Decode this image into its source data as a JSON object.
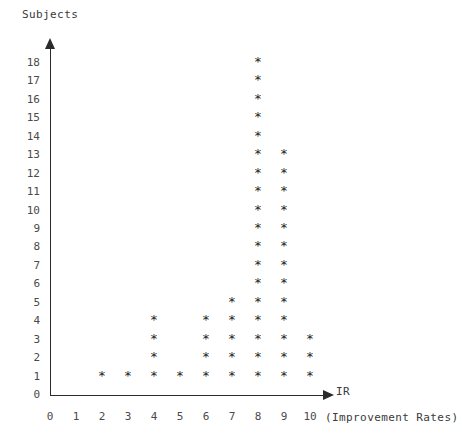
{
  "chart_data": {
    "type": "scatter",
    "plot_style": "dot-plot-asterisk-stack",
    "title": "",
    "ylabel": "Subjects",
    "xlabel": "IR",
    "xlabel_note": "(Improvement Rates)",
    "marker": "*",
    "grid": false,
    "legend": null,
    "xlim": [
      0,
      10
    ],
    "ylim": [
      0,
      18
    ],
    "x_ticks": [
      0,
      1,
      2,
      3,
      4,
      5,
      6,
      7,
      8,
      9,
      10
    ],
    "y_ticks": [
      0,
      1,
      2,
      3,
      4,
      5,
      6,
      7,
      8,
      9,
      10,
      11,
      12,
      13,
      14,
      15,
      16,
      17,
      18
    ],
    "categories": [
      0,
      1,
      2,
      3,
      4,
      5,
      6,
      7,
      8,
      9,
      10
    ],
    "values": [
      0,
      0,
      1,
      1,
      4,
      1,
      4,
      5,
      18,
      13,
      3
    ],
    "columns": [
      {
        "x": 2,
        "count": 1,
        "y_values": [
          1
        ]
      },
      {
        "x": 3,
        "count": 1,
        "y_values": [
          1
        ]
      },
      {
        "x": 4,
        "count": 4,
        "y_values": [
          1,
          2,
          3,
          4
        ]
      },
      {
        "x": 5,
        "count": 1,
        "y_values": [
          1
        ]
      },
      {
        "x": 6,
        "count": 4,
        "y_values": [
          1,
          2,
          3,
          4
        ]
      },
      {
        "x": 7,
        "count": 5,
        "y_values": [
          1,
          2,
          3,
          4,
          5
        ]
      },
      {
        "x": 8,
        "count": 18,
        "y_values": [
          1,
          2,
          3,
          4,
          5,
          6,
          7,
          8,
          9,
          10,
          11,
          12,
          13,
          14,
          15,
          16,
          17,
          18
        ]
      },
      {
        "x": 9,
        "count": 13,
        "y_values": [
          1,
          2,
          3,
          4,
          5,
          6,
          7,
          8,
          9,
          10,
          11,
          12,
          13
        ]
      },
      {
        "x": 10,
        "count": 3,
        "y_values": [
          1,
          2,
          3
        ]
      }
    ],
    "points": [
      [
        2,
        1
      ],
      [
        3,
        1
      ],
      [
        4,
        1
      ],
      [
        4,
        2
      ],
      [
        4,
        3
      ],
      [
        4,
        4
      ],
      [
        5,
        1
      ],
      [
        6,
        1
      ],
      [
        6,
        2
      ],
      [
        6,
        3
      ],
      [
        6,
        4
      ],
      [
        7,
        1
      ],
      [
        7,
        2
      ],
      [
        7,
        3
      ],
      [
        7,
        4
      ],
      [
        7,
        5
      ],
      [
        8,
        1
      ],
      [
        8,
        2
      ],
      [
        8,
        3
      ],
      [
        8,
        4
      ],
      [
        8,
        5
      ],
      [
        8,
        6
      ],
      [
        8,
        7
      ],
      [
        8,
        8
      ],
      [
        8,
        9
      ],
      [
        8,
        10
      ],
      [
        8,
        11
      ],
      [
        8,
        12
      ],
      [
        8,
        13
      ],
      [
        8,
        14
      ],
      [
        8,
        15
      ],
      [
        8,
        16
      ],
      [
        8,
        17
      ],
      [
        8,
        18
      ],
      [
        9,
        1
      ],
      [
        9,
        2
      ],
      [
        9,
        3
      ],
      [
        9,
        4
      ],
      [
        9,
        5
      ],
      [
        9,
        6
      ],
      [
        9,
        7
      ],
      [
        9,
        8
      ],
      [
        9,
        9
      ],
      [
        9,
        10
      ],
      [
        9,
        11
      ],
      [
        9,
        12
      ],
      [
        9,
        13
      ],
      [
        10,
        1
      ],
      [
        10,
        2
      ],
      [
        10,
        3
      ]
    ],
    "colors": {
      "marker": "#222222",
      "axis": "#2b2b2b",
      "tick_text": "#4a4a4a",
      "background": "#ffffff"
    }
  },
  "axes": {
    "y_title": "Subjects",
    "x_title": "IR",
    "x_subtitle": "(Improvement Rates)"
  }
}
